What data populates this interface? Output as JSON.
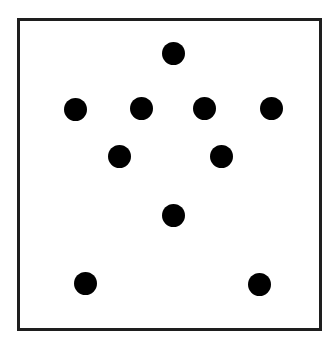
{
  "diagram": {
    "frame": {
      "left": 17,
      "top": 18,
      "right": 322,
      "bottom": 331,
      "border_color": "#1e1e1e",
      "background": "#ffffff"
    },
    "dot_color": "#000000",
    "dot_diameter": 23,
    "dots": [
      {
        "x": 173,
        "y": 53
      },
      {
        "x": 75,
        "y": 109
      },
      {
        "x": 141,
        "y": 108
      },
      {
        "x": 204,
        "y": 108
      },
      {
        "x": 271,
        "y": 108
      },
      {
        "x": 119,
        "y": 156
      },
      {
        "x": 221,
        "y": 156
      },
      {
        "x": 173,
        "y": 215
      },
      {
        "x": 85,
        "y": 283
      },
      {
        "x": 259,
        "y": 284
      }
    ],
    "dot_count": 10
  }
}
